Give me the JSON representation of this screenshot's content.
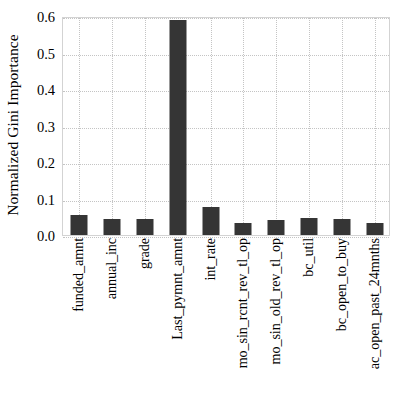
{
  "chart_data": {
    "type": "bar",
    "title": "",
    "xlabel": "",
    "ylabel": "Normalized Gini Importance",
    "ylim": [
      0.0,
      0.6
    ],
    "yticks": [
      "0.0",
      "0.1",
      "0.2",
      "0.3",
      "0.4",
      "0.5",
      "0.6"
    ],
    "ytick_values": [
      0.0,
      0.1,
      0.2,
      0.3,
      0.4,
      0.5,
      0.6
    ],
    "grid": true,
    "grid_style": "dotted",
    "legend": "none",
    "bar_color": "#353535",
    "grid_color": "#c4c4c4",
    "axes_color": "#d3d3d3",
    "categories": [
      "funded_amnt",
      "annual_inc",
      "grade",
      "Last_pymnt_amnt",
      "int_rate",
      "mo_sin_rcnt_rev_tl_op",
      "mo_sin_old_rev_tl_op",
      "bc_util",
      "bc_open_to_buy",
      "ac_open_past_24mnths"
    ],
    "values": [
      0.055,
      0.043,
      0.043,
      0.59,
      0.077,
      0.033,
      0.042,
      0.047,
      0.045,
      0.032
    ]
  }
}
